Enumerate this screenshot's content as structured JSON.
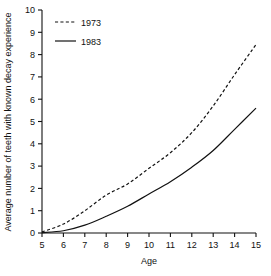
{
  "chart_data": {
    "type": "line",
    "title": "",
    "xlabel": "Age",
    "ylabel": "Average number of teeth with known decay experience",
    "xlim": [
      5,
      15
    ],
    "ylim": [
      0,
      10
    ],
    "grid": false,
    "legend_position": "top-left",
    "x": [
      5,
      6,
      7,
      8,
      9,
      10,
      11,
      12,
      13,
      14,
      15
    ],
    "xticks": [
      "5",
      "6",
      "7",
      "8",
      "9",
      "10",
      "11",
      "12",
      "13",
      "14",
      "15"
    ],
    "yticks": [
      "0",
      "1",
      "2",
      "3",
      "4",
      "5",
      "6",
      "7",
      "8",
      "9",
      "10"
    ],
    "series": [
      {
        "name": "1973",
        "style": "dashed",
        "color": "#111111",
        "values": [
          0.05,
          0.4,
          1.0,
          1.7,
          2.2,
          2.9,
          3.6,
          4.5,
          5.7,
          7.1,
          8.45
        ]
      },
      {
        "name": "1983",
        "style": "solid",
        "color": "#111111",
        "values": [
          0.02,
          0.1,
          0.35,
          0.75,
          1.2,
          1.75,
          2.3,
          2.95,
          3.7,
          4.65,
          5.6
        ]
      }
    ]
  },
  "legend": {
    "entries": [
      {
        "label": "1973",
        "style": "dashed"
      },
      {
        "label": "1983",
        "style": "solid"
      }
    ]
  }
}
